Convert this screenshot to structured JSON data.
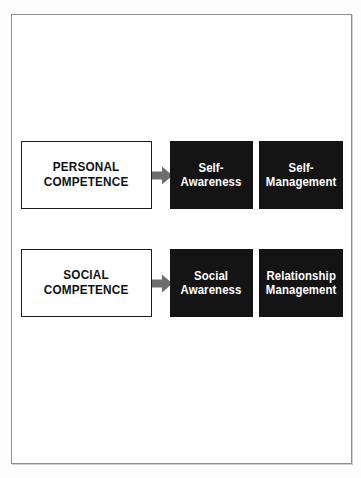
{
  "page": {
    "background_color": "#ffffff",
    "frame_border_color": "#8d8d8f"
  },
  "colors": {
    "box_fill_black": "#141414",
    "box_text_white": "#ffffff",
    "box_fill_white": "#ffffff",
    "box_text_black": "#111111",
    "box_border_black": "#1b1b1b",
    "arrow_gray": "#6e6e6e"
  },
  "diagram": {
    "type": "two-row-flow",
    "arrow_icon": "right-block-arrow-icon",
    "rows": [
      {
        "id": "personal",
        "source_label": "PERSONAL\nCOMPETENCE",
        "targets": [
          {
            "id": "self-awareness",
            "label": "Self-\nAwareness"
          },
          {
            "id": "self-management",
            "label": "Self-\nManagement"
          }
        ]
      },
      {
        "id": "social",
        "source_label": "SOCIAL\nCOMPETENCE",
        "targets": [
          {
            "id": "social-awareness",
            "label": "Social\nAwareness"
          },
          {
            "id": "relationship-management",
            "label": "Relationship\nManagement"
          }
        ]
      }
    ]
  }
}
